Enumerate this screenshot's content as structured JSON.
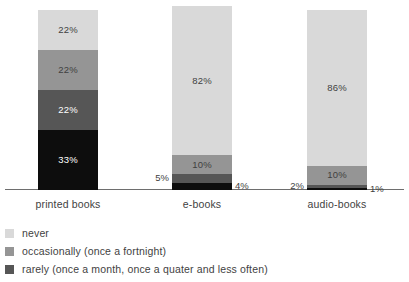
{
  "chart_data": {
    "type": "bar",
    "subtype": "stacked-bar-100",
    "title": "",
    "subtitle": "",
    "xlabel": "",
    "ylabel": "",
    "ylim": [
      0,
      100
    ],
    "grid": false,
    "legend_position": "bottom-left",
    "value_suffix": "%",
    "categories": [
      "printed books",
      "e-books",
      "audio-books"
    ],
    "series": [
      {
        "name": "never",
        "color": "#d9d9d9",
        "values": [
          22,
          82,
          86
        ],
        "labels": [
          "22%",
          "82%",
          "86%"
        ]
      },
      {
        "name": "occasionally (once a fortnight)",
        "color": "#959595",
        "values": [
          22,
          10,
          10
        ],
        "labels": [
          "22%",
          "10%",
          "10%"
        ]
      },
      {
        "name": "rarely (once a month, once a quater and less often)",
        "color": "#565656",
        "values": [
          22,
          5,
          2
        ],
        "labels": [
          "22%",
          "5%",
          "2%"
        ]
      },
      {
        "name": "",
        "color": "#0d0d0d",
        "values": [
          33,
          4,
          1
        ],
        "labels": [
          "33%",
          "4%",
          "1%"
        ]
      }
    ]
  },
  "bars": [
    {
      "category": "printed books",
      "segments": [
        {
          "label": "22%",
          "value": 22,
          "color": "#d9d9d9",
          "text_on": "light",
          "placement": "inside"
        },
        {
          "label": "22%",
          "value": 22,
          "color": "#959595",
          "text_on": "light",
          "placement": "inside"
        },
        {
          "label": "22%",
          "value": 22,
          "color": "#565656",
          "text_on": "dark",
          "placement": "inside"
        },
        {
          "label": "33%",
          "value": 33,
          "color": "#0d0d0d",
          "text_on": "dark",
          "placement": "inside"
        }
      ]
    },
    {
      "category": "e-books",
      "segments": [
        {
          "label": "82%",
          "value": 82,
          "color": "#d9d9d9",
          "text_on": "light",
          "placement": "inside"
        },
        {
          "label": "10%",
          "value": 10,
          "color": "#959595",
          "text_on": "light",
          "placement": "inside"
        },
        {
          "label": "5%",
          "value": 5,
          "color": "#565656",
          "text_on": "light",
          "placement": "outside-left"
        },
        {
          "label": "4%",
          "value": 4,
          "color": "#0d0d0d",
          "text_on": "light",
          "placement": "outside-right"
        }
      ]
    },
    {
      "category": "audio-books",
      "segments": [
        {
          "label": "86%",
          "value": 86,
          "color": "#d9d9d9",
          "text_on": "light",
          "placement": "inside"
        },
        {
          "label": "10%",
          "value": 10,
          "color": "#959595",
          "text_on": "light",
          "placement": "inside"
        },
        {
          "label": "2%",
          "value": 2,
          "color": "#565656",
          "text_on": "light",
          "placement": "outside-left"
        },
        {
          "label": "1%",
          "value": 1,
          "color": "#0d0d0d",
          "text_on": "light",
          "placement": "outside-right"
        }
      ]
    }
  ],
  "legend": {
    "items": [
      {
        "label": "never",
        "color": "#d9d9d9"
      },
      {
        "label": "occasionally (once a fortnight)",
        "color": "#959595"
      },
      {
        "label": "rarely (once a month, once a quater and less often)",
        "color": "#565656"
      }
    ]
  },
  "axis": {
    "line_color": "#6e6e6e"
  }
}
